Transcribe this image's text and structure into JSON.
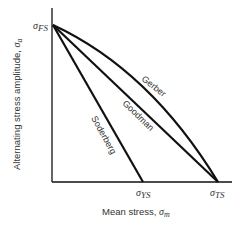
{
  "diagram": {
    "y_axis_label": "Alternating stress amplitude, ",
    "y_axis_symbol": "σ",
    "y_axis_subscript": "a",
    "x_axis_label": "Mean stress, ",
    "x_axis_symbol": "σ",
    "x_axis_subscript": "m",
    "point_fs": {
      "symbol": "σ",
      "subscript": "FS"
    },
    "point_ys": {
      "symbol": "σ",
      "subscript": "YS"
    },
    "point_ts": {
      "symbol": "σ",
      "subscript": "TS"
    },
    "curves": [
      {
        "name": "Soderberg",
        "type": "line",
        "from": "σFS",
        "to": "σYS"
      },
      {
        "name": "Goodman",
        "type": "line",
        "from": "σFS",
        "to": "σTS"
      },
      {
        "name": "Gerber",
        "type": "parabola",
        "from": "σFS",
        "to": "σTS"
      }
    ],
    "line_color": "#111111"
  }
}
